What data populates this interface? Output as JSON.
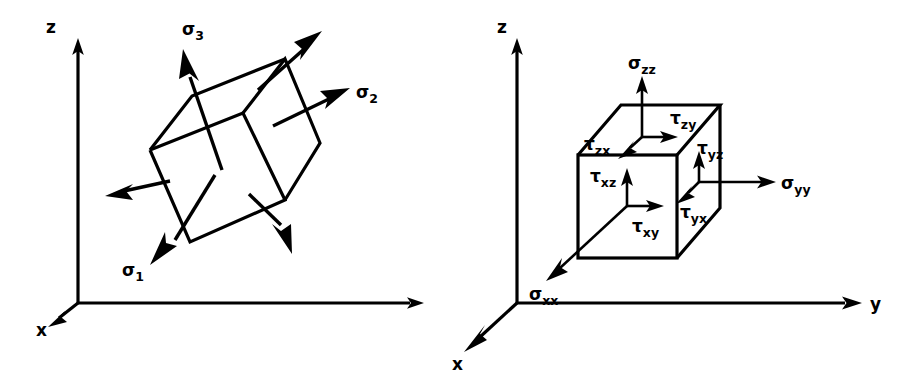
{
  "figure": {
    "background_color": "#ffffff",
    "line_color": "#000000"
  },
  "panels": [
    {
      "id": "principal-stress-panel",
      "name": "principal-stress-diagram",
      "description": "Cube rotated into principal stress orientation with three principal stresses",
      "axes": [
        {
          "id": "z",
          "label": "z",
          "direction": "up"
        },
        {
          "id": "x",
          "label": "x",
          "direction": "down-left"
        },
        {
          "id": "y",
          "label": "y",
          "direction": "right"
        }
      ],
      "stresses": [
        {
          "id": "sigma1",
          "symbol": "σ",
          "subscript": "1",
          "type": "normal"
        },
        {
          "id": "sigma2",
          "symbol": "σ",
          "subscript": "2",
          "type": "normal"
        },
        {
          "id": "sigma3",
          "symbol": "σ",
          "subscript": "3",
          "type": "normal"
        }
      ]
    },
    {
      "id": "cartesian-stress-panel",
      "name": "cartesian-stress-diagram",
      "description": "Cube aligned with coordinate axes showing normal and shear stress components",
      "axes": [
        {
          "id": "z",
          "label": "z",
          "direction": "up"
        },
        {
          "id": "x",
          "label": "x",
          "direction": "down-left"
        },
        {
          "id": "y",
          "label": "y",
          "direction": "right"
        }
      ],
      "stresses": [
        {
          "id": "sigma_xx",
          "symbol": "σ",
          "subscript": "xx",
          "type": "normal"
        },
        {
          "id": "sigma_yy",
          "symbol": "σ",
          "subscript": "yy",
          "type": "normal"
        },
        {
          "id": "sigma_zz",
          "symbol": "σ",
          "subscript": "zz",
          "type": "normal"
        },
        {
          "id": "tau_xy",
          "symbol": "τ",
          "subscript": "xy",
          "type": "shear"
        },
        {
          "id": "tau_xz",
          "symbol": "τ",
          "subscript": "xz",
          "type": "shear"
        },
        {
          "id": "tau_yx",
          "symbol": "τ",
          "subscript": "yx",
          "type": "shear"
        },
        {
          "id": "tau_yz",
          "symbol": "τ",
          "subscript": "yz",
          "type": "shear"
        },
        {
          "id": "tau_zx",
          "symbol": "τ",
          "subscript": "zx",
          "type": "shear"
        },
        {
          "id": "tau_zy",
          "symbol": "τ",
          "subscript": "zy",
          "type": "shear"
        }
      ]
    }
  ],
  "labels": {
    "left": {
      "axis_z": "z",
      "axis_x": "x",
      "axis_y": "",
      "sigma1_sym": "σ",
      "sigma1_sub": "1",
      "sigma2_sym": "σ",
      "sigma2_sub": "2",
      "sigma3_sym": "σ",
      "sigma3_sub": "3"
    },
    "right": {
      "axis_z": "z",
      "axis_x": "x",
      "axis_y": "y",
      "sigma_zz_sym": "σ",
      "sigma_zz_sub": "zz",
      "sigma_yy_sym": "σ",
      "sigma_yy_sub": "yy",
      "sigma_xx_sym": "σ",
      "sigma_xx_sub": "xx",
      "tau_zy_sym": "τ",
      "tau_zy_sub": "zy",
      "tau_zx_sym": "τ",
      "tau_zx_sub": "zx",
      "tau_yz_sym": "τ",
      "tau_yz_sub": "yz",
      "tau_yx_sym": "τ",
      "tau_yx_sub": "yx",
      "tau_xz_sym": "τ",
      "tau_xz_sub": "xz",
      "tau_xy_sym": "τ",
      "tau_xy_sub": "xy"
    }
  }
}
